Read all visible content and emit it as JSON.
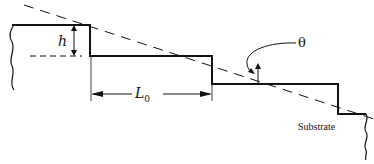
{
  "diagram": {
    "labels": {
      "h": "h",
      "l0_main": "L",
      "l0_sub": "0",
      "theta": "θ",
      "substrate": "Substrate"
    },
    "elements": {
      "steps": [
        {
          "terrace_y": 25,
          "x_start": 12,
          "x_end": 90
        },
        {
          "terrace_y": 56,
          "x_start": 90,
          "x_end": 212
        },
        {
          "terrace_y": 84,
          "x_start": 212,
          "x_end": 338
        },
        {
          "terrace_y": 114,
          "x_start": 338,
          "x_end": 366
        }
      ],
      "step_height_label": "h",
      "terrace_length_label": "L0",
      "miscut_angle_label": "θ"
    },
    "colors": {
      "line": "#111111",
      "background": "#ffffff"
    }
  }
}
